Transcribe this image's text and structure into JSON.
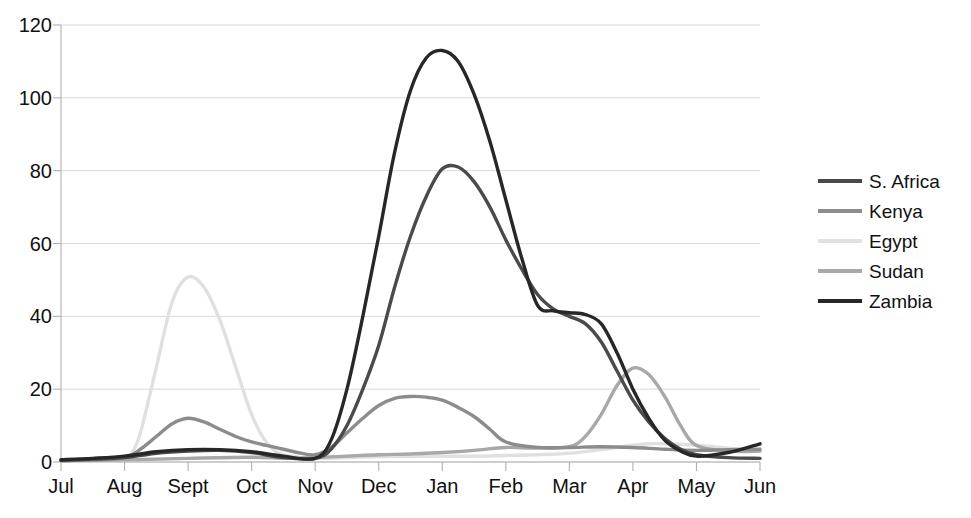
{
  "chart_data": {
    "type": "line",
    "title": "",
    "xlabel": "",
    "ylabel": "",
    "categories": [
      "Jul",
      "Aug",
      "Sept",
      "Oct",
      "Nov",
      "Dec",
      "Jan",
      "Feb",
      "Mar",
      "Apr",
      "May",
      "Jun"
    ],
    "yticks": [
      0,
      20,
      40,
      60,
      80,
      100,
      120
    ],
    "ylim": [
      0,
      120
    ],
    "grid": true,
    "legend_position": "right",
    "series": [
      {
        "name": "S. Africa",
        "color": "#4a4a4a",
        "values": [
          0.5,
          1.0,
          3.0,
          2.5,
          1.0,
          30.0,
          81.0,
          62.0,
          40.0,
          17.0,
          2.0,
          1.0
        ],
        "dense_x": [
          0,
          0.5,
          1,
          1.5,
          2,
          2.5,
          3,
          3.5,
          4,
          4.25,
          4.5,
          4.75,
          5,
          5.25,
          5.5,
          5.75,
          6,
          6.25,
          6.5,
          6.75,
          7,
          7.25,
          7.5,
          7.75,
          8,
          8.25,
          8.5,
          8.75,
          9,
          9.25,
          9.5,
          9.75,
          10,
          10.5,
          11
        ],
        "dense_y": [
          0.5,
          0.8,
          1.2,
          2.4,
          3.0,
          3.2,
          2.6,
          1.2,
          1.0,
          3.5,
          10.0,
          20.0,
          32.0,
          48.0,
          62.0,
          73.0,
          80.5,
          81.0,
          77.0,
          70.0,
          61.0,
          53.0,
          46.0,
          42.0,
          40.0,
          38.0,
          33.0,
          25.0,
          17.0,
          11.0,
          6.5,
          3.5,
          2.0,
          1.2,
          1.0
        ]
      },
      {
        "name": "Kenya",
        "color": "#8c8c8c",
        "values": [
          0.5,
          1.0,
          12.0,
          5.0,
          6.0,
          18.0,
          16.0,
          4.0,
          4.0,
          3.0,
          3.5,
          3.5
        ],
        "dense_x": [
          0,
          0.5,
          1,
          1.25,
          1.5,
          1.75,
          2,
          2.25,
          2.5,
          2.75,
          3,
          3.25,
          3.5,
          3.75,
          4,
          4.25,
          4.5,
          4.75,
          5,
          5.25,
          5.5,
          5.75,
          6,
          6.25,
          6.5,
          6.75,
          7,
          7.5,
          8,
          8.5,
          9,
          9.5,
          10,
          10.5,
          11
        ],
        "dense_y": [
          0.4,
          0.6,
          1.2,
          3.5,
          7.0,
          10.5,
          12.0,
          11.0,
          9.0,
          7.0,
          5.5,
          4.5,
          3.5,
          2.5,
          2.0,
          4.0,
          8.0,
          12.0,
          15.5,
          17.5,
          18.0,
          17.8,
          17.0,
          15.0,
          12.5,
          9.0,
          5.5,
          4.0,
          4.0,
          4.2,
          4.0,
          3.5,
          3.2,
          3.4,
          3.5
        ]
      },
      {
        "name": "Egypt",
        "color": "#e0e0e0",
        "values": [
          0.2,
          1.0,
          51.0,
          8.0,
          1.0,
          1.5,
          1.5,
          1.5,
          2.0,
          5.0,
          4.5,
          3.0
        ],
        "dense_x": [
          0,
          0.5,
          1,
          1.1,
          1.25,
          1.5,
          1.75,
          2,
          2.25,
          2.5,
          2.75,
          3,
          3.25,
          3.5,
          4,
          4.5,
          5,
          5.5,
          6,
          6.5,
          7,
          7.5,
          8,
          8.5,
          9,
          9.25,
          9.5,
          10,
          10.5,
          11
        ],
        "dense_y": [
          0.2,
          0.3,
          0.6,
          2.0,
          8.0,
          26.0,
          44.0,
          50.8,
          48.0,
          39.0,
          26.0,
          13.0,
          5.0,
          2.0,
          1.0,
          1.2,
          1.5,
          1.5,
          1.6,
          1.6,
          1.8,
          2.0,
          2.4,
          3.4,
          4.6,
          5.0,
          5.0,
          4.6,
          3.8,
          3.0
        ]
      },
      {
        "name": "Sudan",
        "color": "#a8a8a8",
        "values": [
          0.3,
          0.6,
          1.0,
          1.5,
          1.0,
          2.0,
          2.5,
          4.0,
          8.0,
          26.0,
          3.0,
          3.0
        ],
        "dense_x": [
          0,
          1,
          2,
          3,
          3.5,
          4,
          4.5,
          5,
          5.5,
          6,
          6.5,
          7,
          7.5,
          8,
          8.25,
          8.5,
          8.75,
          9,
          9.25,
          9.5,
          9.75,
          10,
          10.5,
          11
        ],
        "dense_y": [
          0.3,
          0.6,
          1.0,
          1.3,
          1.0,
          1.2,
          1.6,
          2.0,
          2.2,
          2.6,
          3.2,
          4.0,
          3.8,
          4.2,
          7.0,
          13.0,
          21.0,
          25.8,
          24.0,
          18.0,
          10.0,
          4.5,
          3.0,
          3.0
        ]
      },
      {
        "name": "Zambia",
        "color": "#272727",
        "values": [
          0.5,
          1.0,
          3.0,
          3.0,
          1.0,
          55.0,
          113.0,
          58.0,
          40.0,
          12.0,
          1.5,
          5.0
        ],
        "dense_x": [
          0,
          0.5,
          1,
          1.5,
          2,
          2.5,
          3,
          3.5,
          4,
          4.25,
          4.5,
          4.75,
          5,
          5.25,
          5.5,
          5.75,
          6,
          6.25,
          6.5,
          6.75,
          7,
          7.25,
          7.5,
          7.75,
          8,
          8.25,
          8.5,
          8.75,
          9,
          9.25,
          9.5,
          9.75,
          10,
          10.5,
          11
        ],
        "dense_y": [
          0.6,
          1.0,
          1.6,
          2.8,
          3.4,
          3.4,
          2.8,
          1.6,
          1.0,
          6.0,
          20.0,
          40.0,
          62.0,
          85.0,
          102.0,
          111.0,
          113.0,
          110.0,
          101.0,
          88.0,
          72.0,
          56.0,
          43.0,
          41.5,
          41.0,
          40.5,
          38.0,
          30.0,
          20.0,
          12.0,
          6.0,
          3.0,
          1.6,
          2.6,
          5.0
        ]
      }
    ]
  },
  "legend": {
    "items": [
      {
        "label": "S. Africa"
      },
      {
        "label": "Kenya"
      },
      {
        "label": "Egypt"
      },
      {
        "label": "Sudan"
      },
      {
        "label": "Zambia"
      }
    ]
  },
  "axes": {
    "y_tick_labels": [
      "0",
      "20",
      "40",
      "60",
      "80",
      "100",
      "120"
    ],
    "x_tick_labels": [
      "Jul",
      "Aug",
      "Sept",
      "Oct",
      "Nov",
      "Dec",
      "Jan",
      "Feb",
      "Mar",
      "Apr",
      "May",
      "Jun"
    ]
  },
  "colors": {
    "grid": "#d9d9d9",
    "axis": "#b0b0b0",
    "background": "#ffffff"
  }
}
